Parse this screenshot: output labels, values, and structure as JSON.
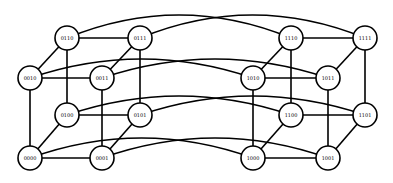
{
  "diagram": {
    "radius": 12,
    "stroke_color": "#000000",
    "fill_color": "#ffffff",
    "nodes": [
      {
        "id": "0110",
        "label": "0110",
        "x": 67,
        "y": 38
      },
      {
        "id": "0111",
        "label": "0111",
        "x": 140,
        "y": 38
      },
      {
        "id": "0010",
        "label": "0010",
        "x": 30,
        "y": 78
      },
      {
        "id": "0011",
        "label": "0011",
        "x": 102,
        "y": 78
      },
      {
        "id": "0100",
        "label": "0100",
        "x": 67,
        "y": 115
      },
      {
        "id": "0101",
        "label": "0101",
        "x": 140,
        "y": 115
      },
      {
        "id": "0000",
        "label": "0000",
        "x": 30,
        "y": 158
      },
      {
        "id": "0001",
        "label": "0001",
        "x": 102,
        "y": 158
      },
      {
        "id": "1110",
        "label": "1110",
        "x": 291,
        "y": 38
      },
      {
        "id": "1111",
        "label": "1111",
        "x": 365,
        "y": 38
      },
      {
        "id": "1010",
        "label": "1010",
        "x": 253,
        "y": 78
      },
      {
        "id": "1011",
        "label": "1011",
        "x": 328,
        "y": 78
      },
      {
        "id": "1100",
        "label": "1100",
        "x": 291,
        "y": 115
      },
      {
        "id": "1101",
        "label": "1101",
        "x": 365,
        "y": 115
      },
      {
        "id": "1000",
        "label": "1000",
        "x": 253,
        "y": 158
      },
      {
        "id": "1001",
        "label": "1001",
        "x": 328,
        "y": 158
      }
    ],
    "straight_edges": [
      [
        "0110",
        "0111"
      ],
      [
        "0010",
        "0011"
      ],
      [
        "0100",
        "0101"
      ],
      [
        "0000",
        "0001"
      ],
      [
        "0110",
        "0010"
      ],
      [
        "0111",
        "0011"
      ],
      [
        "0100",
        "0000"
      ],
      [
        "0101",
        "0001"
      ],
      [
        "0110",
        "0100"
      ],
      [
        "0111",
        "0101"
      ],
      [
        "0010",
        "0000"
      ],
      [
        "0011",
        "0001"
      ],
      [
        "1110",
        "1111"
      ],
      [
        "1010",
        "1011"
      ],
      [
        "1100",
        "1101"
      ],
      [
        "1000",
        "1001"
      ],
      [
        "1110",
        "1010"
      ],
      [
        "1111",
        "1011"
      ],
      [
        "1100",
        "1000"
      ],
      [
        "1101",
        "1001"
      ],
      [
        "1110",
        "1100"
      ],
      [
        "1111",
        "1101"
      ],
      [
        "1010",
        "1000"
      ],
      [
        "1011",
        "1001"
      ]
    ],
    "curved_edges": [
      {
        "from": "0110",
        "to": "1110",
        "ctrl_y": -8
      },
      {
        "from": "0111",
        "to": "1111",
        "ctrl_y": -8
      },
      {
        "from": "0010",
        "to": "1010",
        "ctrl_y": 40
      },
      {
        "from": "0011",
        "to": "1011",
        "ctrl_y": 40
      },
      {
        "from": "0100",
        "to": "1100",
        "ctrl_y": 77
      },
      {
        "from": "0101",
        "to": "1101",
        "ctrl_y": 77
      },
      {
        "from": "0000",
        "to": "1000",
        "ctrl_y": 118
      },
      {
        "from": "0001",
        "to": "1001",
        "ctrl_y": 118
      }
    ]
  }
}
